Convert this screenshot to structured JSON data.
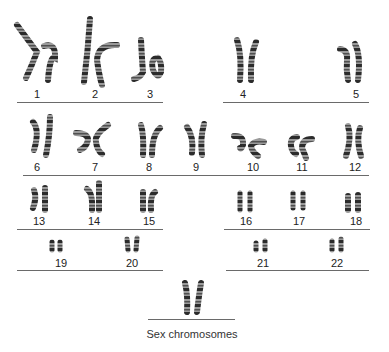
{
  "figure": {
    "caption": "Sex chromosomes",
    "groups": [
      {
        "row": 1,
        "labels": [
          "1",
          "2",
          "3"
        ]
      },
      {
        "row": 1,
        "labels": [
          "4",
          "5"
        ]
      },
      {
        "row": 2,
        "labels": [
          "6",
          "7",
          "8",
          "9",
          "10",
          "11",
          "12"
        ]
      },
      {
        "row": 3,
        "labels": [
          "13",
          "14",
          "15"
        ]
      },
      {
        "row": 3,
        "labels": [
          "16",
          "17",
          "18"
        ]
      },
      {
        "row": 4,
        "labels": [
          "19",
          "20"
        ]
      },
      {
        "row": 4,
        "labels": [
          "21",
          "22"
        ]
      }
    ]
  },
  "labels": {
    "c1": "1",
    "c2": "2",
    "c3": "3",
    "c4": "4",
    "c5": "5",
    "c6": "6",
    "c7": "7",
    "c8": "8",
    "c9": "9",
    "c10": "10",
    "c11": "11",
    "c12": "12",
    "c13": "13",
    "c14": "14",
    "c15": "15",
    "c16": "16",
    "c17": "17",
    "c18": "18",
    "c19": "19",
    "c20": "20",
    "c21": "21",
    "c22": "22"
  },
  "colors": {
    "band_dark": "#2a2a2a",
    "band_light": "#c8c8c8",
    "rule": "#6a6a6a"
  }
}
